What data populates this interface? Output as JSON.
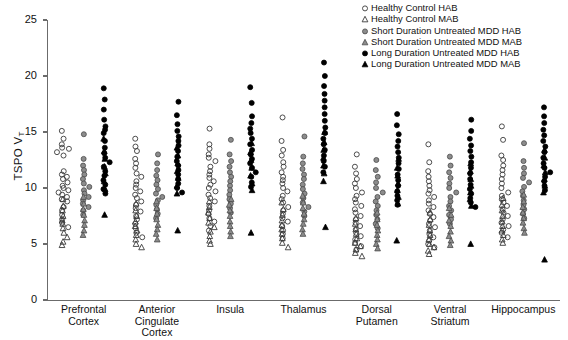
{
  "chart_data": {
    "type": "scatter",
    "title": "",
    "xlabel": "",
    "ylabel": "TSPO VT",
    "ylabel_base": "TSPO V",
    "ylabel_sub": "T",
    "ylim": [
      0,
      25
    ],
    "yticks": [
      0,
      5,
      10,
      15,
      20,
      25
    ],
    "grid": false,
    "legend_position": "top-right",
    "categories": [
      "Prefrontal Cortex",
      "Anterior Cingulate Cortex",
      "Insula",
      "Thalamus",
      "Dorsal Putamen",
      "Ventral Striatum",
      "Hippocampus"
    ],
    "category_lines": [
      [
        "Prefrontal",
        "Cortex"
      ],
      [
        "Anterior",
        "Cingulate Cortex"
      ],
      [
        "Insula",
        ""
      ],
      [
        "Thalamus",
        ""
      ],
      [
        "Dorsal",
        "Putamen"
      ],
      [
        "Ventral",
        "Striatum"
      ],
      [
        "Hippocampus",
        ""
      ]
    ],
    "legend": [
      {
        "label": "Healthy Control HAB",
        "marker": "circle",
        "fill": "open",
        "color": "#333333"
      },
      {
        "label": "Healthy Control MAB",
        "marker": "triangle",
        "fill": "open",
        "color": "#333333"
      },
      {
        "label": "Short Duration Untreated MDD HAB",
        "marker": "circle",
        "fill": "gray",
        "color": "#808080"
      },
      {
        "label": "Short Duration Untreated MDD MAB",
        "marker": "triangle",
        "fill": "gray",
        "color": "#808080"
      },
      {
        "label": "Long Duration Untreated MDD HAB",
        "marker": "circle",
        "fill": "solid",
        "color": "#000000"
      },
      {
        "label": "Long Duration Untreated MDD MAB",
        "marker": "triangle",
        "fill": "solid",
        "color": "#000000"
      }
    ],
    "series": [
      {
        "name": "Healthy Control HAB",
        "marker": "circle",
        "fill": "open",
        "values_by_category": {
          "Prefrontal Cortex": [
            15.1,
            14.4,
            13.9,
            13.6,
            13.5,
            13.2,
            12.9,
            11.5,
            11.2,
            11.0,
            10.8,
            10.5,
            10.2,
            10.0,
            9.8,
            9.6,
            9.4,
            9.2,
            9.0,
            8.8,
            8.3,
            8.0,
            7.6,
            7.2,
            6.9,
            6.5
          ],
          "Anterior Cingulate Cortex": [
            14.4,
            13.7,
            13.3,
            12.6,
            12.2,
            11.8,
            11.3,
            11.0,
            10.6,
            10.3,
            10.0,
            9.7,
            9.4,
            9.1,
            8.8,
            8.5,
            8.2,
            7.9,
            7.5,
            7.2,
            6.8,
            6.4,
            6.0,
            5.6
          ],
          "Insula": [
            15.3,
            13.9,
            13.5,
            13.0,
            12.7,
            12.4,
            11.9,
            11.5,
            11.2,
            10.9,
            10.6,
            10.3,
            10.0,
            9.7,
            9.4,
            9.1,
            8.8,
            8.4,
            8.0,
            7.7,
            7.3,
            7.0,
            6.6,
            6.2
          ],
          "Thalamus": [
            16.3,
            14.2,
            13.4,
            12.9,
            12.3,
            11.9,
            11.4,
            11.0,
            10.7,
            10.4,
            10.0,
            9.7,
            9.3,
            9.0,
            8.7,
            8.3,
            8.0,
            7.7,
            7.3,
            7.0,
            6.6,
            6.2,
            5.9,
            5.5
          ],
          "Dorsal Putamen": [
            13.0,
            11.9,
            11.3,
            10.8,
            10.4,
            10.0,
            9.6,
            9.3,
            9.0,
            8.7,
            8.4,
            8.1,
            7.8,
            7.5,
            7.2,
            6.9,
            6.6,
            6.3,
            6.0,
            5.7,
            5.4,
            5.1,
            4.8,
            4.5
          ],
          "Ventral Striatum": [
            13.9,
            12.3,
            11.5,
            11.0,
            10.6,
            10.2,
            9.8,
            9.5,
            9.2,
            8.9,
            8.6,
            8.3,
            8.0,
            7.7,
            7.4,
            7.1,
            6.8,
            6.5,
            6.2,
            5.9,
            5.6,
            5.3,
            5.0,
            4.7
          ],
          "Hippocampus": [
            15.5,
            14.3,
            12.9,
            12.5,
            12.0,
            11.6,
            11.2,
            10.8,
            10.4,
            10.0,
            9.6,
            9.3,
            9.0,
            8.7,
            8.4,
            8.1,
            7.8,
            7.5,
            7.2,
            6.9,
            6.6,
            6.3,
            6.0,
            5.6
          ]
        }
      },
      {
        "name": "Healthy Control MAB",
        "marker": "triangle",
        "fill": "open",
        "values_by_category": {
          "Prefrontal Cortex": [
            9.0,
            8.4,
            8.0,
            7.5,
            7.1,
            6.8,
            6.4,
            6.0,
            5.6,
            5.2,
            4.9
          ],
          "Anterior Cingulate Cortex": [
            8.6,
            8.0,
            7.5,
            7.0,
            6.6,
            6.2,
            5.8,
            5.4,
            5.0,
            4.7
          ],
          "Insula": [
            8.8,
            8.3,
            7.8,
            7.3,
            6.9,
            6.5,
            6.1,
            5.7,
            5.3,
            5.0
          ],
          "Thalamus": [
            8.7,
            8.1,
            7.6,
            7.1,
            6.7,
            6.3,
            5.9,
            5.5,
            5.1,
            4.7
          ],
          "Dorsal Putamen": [
            7.3,
            6.8,
            6.3,
            5.9,
            5.5,
            5.1,
            4.8,
            4.5,
            4.2,
            3.9
          ],
          "Ventral Striatum": [
            7.8,
            7.2,
            6.7,
            6.2,
            5.8,
            5.4,
            5.0,
            4.7,
            4.4,
            4.1
          ],
          "Hippocampus": [
            9.1,
            8.5,
            8.0,
            7.5,
            7.0,
            6.6,
            6.2,
            5.8,
            5.4,
            5.1
          ]
        }
      },
      {
        "name": "Short Duration Untreated MDD HAB",
        "marker": "circle",
        "fill": "gray",
        "values_by_category": {
          "Prefrontal Cortex": [
            14.8,
            12.6,
            12.0,
            11.6,
            11.2,
            10.8,
            10.4,
            10.1,
            9.8,
            9.5,
            9.2,
            8.9,
            8.6,
            8.3,
            8.0,
            7.6
          ],
          "Anterior Cingulate Cortex": [
            13.0,
            12.2,
            11.6,
            11.1,
            10.7,
            10.3,
            9.9,
            9.5,
            9.2,
            8.9,
            8.5,
            8.1,
            7.7,
            7.3
          ],
          "Insula": [
            14.3,
            13.0,
            12.4,
            11.9,
            11.4,
            11.0,
            10.6,
            10.2,
            9.8,
            9.4,
            9.0,
            8.6,
            8.2,
            7.8
          ],
          "Thalamus": [
            14.6,
            12.8,
            12.2,
            11.7,
            11.2,
            10.8,
            10.3,
            9.9,
            9.5,
            9.1,
            8.7,
            8.3,
            7.9,
            7.5
          ],
          "Dorsal Putamen": [
            12.5,
            11.6,
            11.0,
            10.5,
            10.0,
            9.6,
            9.2,
            8.8,
            8.4,
            8.0,
            7.6,
            7.2,
            6.8,
            6.4
          ],
          "Ventral Striatum": [
            12.8,
            12.0,
            11.4,
            10.9,
            10.4,
            10.0,
            9.6,
            9.2,
            8.8,
            8.4,
            8.0,
            7.6,
            7.2,
            6.8
          ],
          "Hippocampus": [
            14.0,
            12.4,
            11.8,
            11.3,
            10.9,
            10.5,
            10.1,
            9.7,
            9.3,
            8.9,
            8.5,
            8.1,
            7.7,
            7.3
          ]
        }
      },
      {
        "name": "Short Duration Untreated MDD MAB",
        "marker": "triangle",
        "fill": "gray",
        "values_by_category": {
          "Prefrontal Cortex": [
            9.2,
            8.6,
            8.1,
            7.6,
            7.1,
            6.7,
            6.2,
            5.8
          ],
          "Anterior Cingulate Cortex": [
            8.8,
            8.2,
            7.7,
            7.2,
            6.7,
            6.3,
            5.9,
            5.4
          ],
          "Insula": [
            9.0,
            8.5,
            8.0,
            7.5,
            7.0,
            6.6,
            6.1,
            5.7
          ],
          "Thalamus": [
            9.3,
            8.7,
            8.2,
            7.7,
            7.2,
            6.8,
            6.3,
            5.9
          ],
          "Dorsal Putamen": [
            7.8,
            7.2,
            6.7,
            6.2,
            5.8,
            5.4,
            5.0,
            4.6
          ],
          "Ventral Striatum": [
            8.2,
            7.6,
            7.1,
            6.6,
            6.1,
            5.7,
            5.3,
            4.9
          ],
          "Hippocampus": [
            9.4,
            8.8,
            8.3,
            7.8,
            7.3,
            6.9,
            6.4,
            6.0
          ]
        }
      },
      {
        "name": "Long Duration Untreated MDD HAB",
        "marker": "circle",
        "fill": "solid",
        "values_by_category": {
          "Prefrontal Cortex": [
            18.9,
            17.9,
            17.0,
            16.1,
            15.5,
            15.2,
            14.9,
            14.2,
            13.6,
            13.1,
            12.7,
            12.3,
            11.9,
            11.5,
            11.1,
            10.7,
            10.3,
            9.9,
            9.5
          ],
          "Anterior Cingulate Cortex": [
            17.7,
            16.5,
            15.7,
            15.1,
            14.6,
            14.2,
            13.8,
            13.3,
            12.8,
            12.4,
            12.0,
            11.6,
            11.2,
            10.8,
            10.4,
            10.0,
            9.6
          ],
          "Insula": [
            19.0,
            17.6,
            16.4,
            15.8,
            15.3,
            14.9,
            14.4,
            13.9,
            13.4,
            13.0,
            12.6,
            12.2,
            11.8,
            11.4,
            11.0,
            10.5,
            10.1
          ],
          "Thalamus": [
            21.2,
            20.0,
            19.1,
            18.4,
            17.8,
            17.2,
            16.6,
            16.0,
            15.4,
            14.9,
            14.4,
            13.9,
            13.4,
            12.9,
            12.4,
            11.9,
            11.4
          ],
          "Dorsal Putamen": [
            16.6,
            15.6,
            14.8,
            14.2,
            13.7,
            13.2,
            12.7,
            12.2,
            11.7,
            11.2,
            10.7,
            10.2,
            9.7,
            9.3,
            8.9,
            8.5
          ],
          "Ventral Striatum": [
            16.1,
            15.1,
            14.4,
            13.8,
            13.3,
            12.8,
            12.3,
            11.8,
            11.3,
            10.8,
            10.3,
            9.9,
            9.5,
            9.1,
            8.7,
            8.3
          ],
          "Hippocampus": [
            17.2,
            16.4,
            15.8,
            15.2,
            14.7,
            14.2,
            13.7,
            13.2,
            12.7,
            12.2,
            11.8,
            11.4,
            11.0,
            10.6,
            10.2,
            9.8
          ]
        }
      },
      {
        "name": "Long Duration Untreated MDD MAB",
        "marker": "triangle",
        "fill": "solid",
        "values_by_category": {
          "Prefrontal Cortex": [
            14.4,
            13.3,
            12.6,
            11.9,
            11.3,
            10.6,
            9.9,
            7.6
          ],
          "Anterior Cingulate Cortex": [
            13.6,
            12.9,
            12.2,
            11.5,
            10.9,
            10.2,
            9.5,
            6.2
          ],
          "Insula": [
            14.0,
            13.2,
            12.5,
            11.8,
            11.1,
            10.4,
            9.8,
            6.0
          ],
          "Thalamus": [
            15.0,
            14.1,
            13.4,
            12.7,
            12.0,
            11.3,
            10.6,
            6.5
          ],
          "Dorsal Putamen": [
            12.6,
            11.8,
            11.1,
            10.4,
            9.8,
            9.2,
            8.6,
            5.3
          ],
          "Ventral Striatum": [
            12.2,
            11.5,
            10.8,
            10.2,
            9.6,
            9.0,
            8.4,
            5.0
          ],
          "Hippocampus": [
            13.4,
            12.7,
            12.0,
            11.4,
            10.8,
            10.2,
            9.6,
            3.6
          ]
        }
      }
    ]
  }
}
